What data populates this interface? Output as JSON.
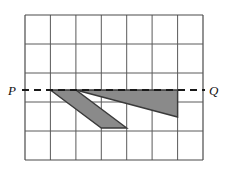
{
  "figure": {
    "background_color": "#ffffff",
    "grid": {
      "x_start": 25,
      "y_start": 15,
      "x_end": 203,
      "y_end": 160,
      "columns": 7,
      "rows": 5,
      "cell_width": 25.43,
      "cell_height": 29.0,
      "x_lines": [
        25,
        50.4,
        75.9,
        101.3,
        126.7,
        152.1,
        177.6,
        203
      ],
      "y_lines": [
        15,
        44,
        73,
        102,
        131,
        160
      ],
      "line_color": "#555555",
      "line_width": 1,
      "border_color": "#444444",
      "border_width": 1.2
    },
    "dashed_line": {
      "label_start": "P",
      "label_end": "Q",
      "y": 90,
      "x_start": 22,
      "x_end": 205,
      "color": "#1a1a1a",
      "width": 2.2,
      "dash_pattern": "7 5"
    },
    "shapes": [
      {
        "name": "left-shaded-parallelogram",
        "type": "polygon",
        "points": "50.4,90 75.9,90 126.7,128 101.3,128",
        "fill": "#8a8a8a",
        "stroke": "#3a3a3a",
        "stroke_width": 1.4,
        "opacity": 1
      },
      {
        "name": "right-shaded-triangle",
        "type": "polygon",
        "points": "75.9,90 177.6,90 177.6,117",
        "fill": "#8a8a8a",
        "stroke": "#3a3a3a",
        "stroke_width": 1.4,
        "opacity": 1
      }
    ],
    "labels": {
      "p": "P",
      "q": "Q"
    }
  }
}
